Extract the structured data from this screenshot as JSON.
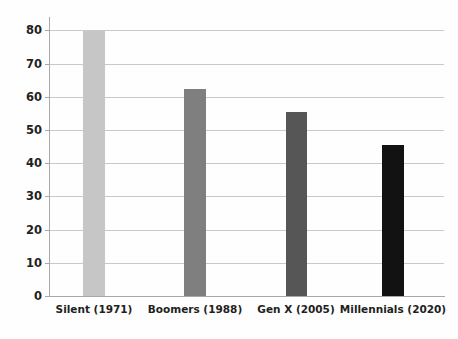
{
  "chart_data": {
    "type": "bar",
    "title": "",
    "subtitle": "",
    "xlabel": "",
    "ylabel": "",
    "categories": [
      "Silent (1971)",
      "Boomers (1988)",
      "Gen X (2005)",
      "Millennials (2020)"
    ],
    "values": [
      79.8,
      62.2,
      55.3,
      45.5
    ],
    "series": [
      {
        "name": "",
        "values": [
          79.8,
          62.2,
          55.3,
          45.5
        ]
      }
    ],
    "bar_colors": [
      "#c6c6c6",
      "#7f7f7f",
      "#565656",
      "#121212"
    ],
    "ylim": [
      0,
      84
    ],
    "y_ticks": [
      0,
      10,
      20,
      30,
      40,
      50,
      60,
      70,
      80
    ],
    "y_tick_labels": [
      "0",
      "10",
      "20",
      "30",
      "40",
      "50",
      "60",
      "70",
      "80"
    ],
    "grid": true,
    "grid_axis": "y",
    "grid_color": "#c9c9c9",
    "axis_color": "#a9a9a9",
    "legend": false,
    "legend_position": "none",
    "background_color": "#fefefe",
    "text_color": "#231f20",
    "annotations": []
  },
  "axis": {
    "y_label_0": "0",
    "y_label_10": "10",
    "y_label_20": "20",
    "y_label_30": "30",
    "y_label_40": "40",
    "y_label_50": "50",
    "y_label_60": "60",
    "y_label_70": "70",
    "y_label_80": "80"
  },
  "categories": {
    "c0": "Silent (1971)",
    "c1": "Boomers (1988)",
    "c2": "Gen X (2005)",
    "c3": "Millennials (2020)"
  }
}
